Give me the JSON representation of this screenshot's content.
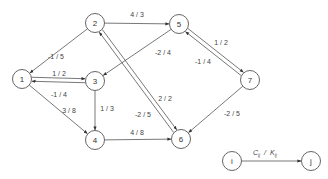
{
  "diagram": {
    "type": "directed-network-graph",
    "nodes": [
      {
        "id": "1",
        "label": "1",
        "x": 22,
        "y": 79
      },
      {
        "id": "2",
        "label": "2",
        "x": 95,
        "y": 23
      },
      {
        "id": "3",
        "label": "3",
        "x": 95,
        "y": 81
      },
      {
        "id": "4",
        "label": "4",
        "x": 95,
        "y": 140
      },
      {
        "id": "5",
        "label": "5",
        "x": 179,
        "y": 24
      },
      {
        "id": "6",
        "label": "6",
        "x": 181,
        "y": 139
      },
      {
        "id": "7",
        "label": "7",
        "x": 250,
        "y": 80
      }
    ],
    "edges": [
      {
        "from": "2",
        "to": "1",
        "label": "-1 / 5",
        "lx": 56,
        "ly": 56,
        "offset": 0
      },
      {
        "from": "1",
        "to": "3",
        "label": "1 / 2",
        "lx": 59,
        "ly": 73,
        "offset": -2
      },
      {
        "from": "3",
        "to": "1",
        "label": "-1 / 4",
        "lx": 59,
        "ly": 94,
        "offset": -2
      },
      {
        "from": "1",
        "to": "4",
        "label": "3 / 8",
        "lx": 69,
        "ly": 110,
        "offset": 0
      },
      {
        "from": "3",
        "to": "4",
        "label": "1 / 3",
        "lx": 107,
        "ly": 108,
        "offset": 0
      },
      {
        "from": "2",
        "to": "5",
        "label": "4 / 3",
        "lx": 137,
        "ly": 14,
        "offset": 0
      },
      {
        "from": "5",
        "to": "3",
        "label": "-2 / 4",
        "lx": 163,
        "ly": 52,
        "offset": 0
      },
      {
        "from": "2",
        "to": "6",
        "label": "2 / 2",
        "lx": 165,
        "ly": 98,
        "offset": -2
      },
      {
        "from": "6",
        "to": "2",
        "label": "-2 / 5",
        "lx": 143,
        "ly": 114,
        "offset": -2
      },
      {
        "from": "4",
        "to": "6",
        "label": "4 / 8",
        "lx": 137,
        "ly": 132,
        "offset": 0
      },
      {
        "from": "5",
        "to": "7",
        "label": "1 / 2",
        "lx": 221,
        "ly": 42,
        "offset": -2
      },
      {
        "from": "7",
        "to": "5",
        "label": "-1 / 4",
        "lx": 203,
        "ly": 61,
        "offset": -2
      },
      {
        "from": "7",
        "to": "6",
        "label": "-2 / 5",
        "lx": 232,
        "ly": 113,
        "offset": 0
      }
    ],
    "legend": {
      "from_node": {
        "label": "i",
        "x": 232,
        "y": 161
      },
      "to_node": {
        "label": "j",
        "x": 311,
        "y": 161
      },
      "edge_label_cost": "C",
      "edge_label_cost_sub": "ij",
      "edge_label_sep": "/",
      "edge_label_cap": "K",
      "edge_label_cap_sub": "ij"
    },
    "colors": {
      "stroke": "#555555",
      "text": "#333333",
      "background": "#ffffff"
    }
  }
}
